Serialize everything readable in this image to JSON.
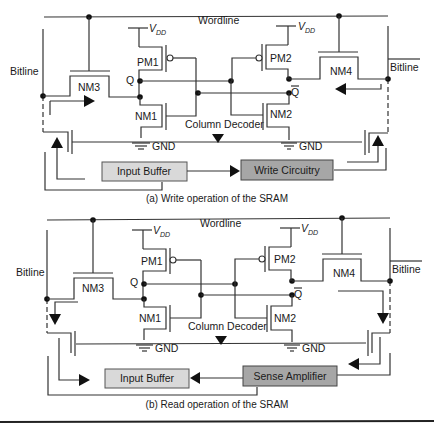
{
  "panels": [
    {
      "id": "write",
      "caption": "(a) Write operation of the SRAM",
      "wordline": "Wordline",
      "bitline_left": "Bitline",
      "bitline_right": "Bitline",
      "vdd_left": "V",
      "vdd_left_sub": "DD",
      "vdd_right": "V",
      "vdd_right_sub": "DD",
      "transistors": {
        "pm1": "PM1",
        "pm2": "PM2",
        "nm1": "NM1",
        "nm2": "NM2",
        "nm3": "NM3",
        "nm4": "NM4"
      },
      "node_q": "Q",
      "node_qbar": "Q",
      "column_decoder": "Column Decoder",
      "gnd_left": "GND",
      "gnd_right": "GND",
      "box_left": {
        "label": "Input Buffer",
        "color": "#d9d9d9"
      },
      "box_right": {
        "label": "Write Circuitry",
        "color": "#a6a6a6"
      }
    },
    {
      "id": "read",
      "caption": "(b) Read operation of the SRAM",
      "wordline": "Wordline",
      "bitline_left": "Bitline",
      "bitline_right": "Bitline",
      "vdd_left": "V",
      "vdd_left_sub": "DD",
      "vdd_right": "V",
      "vdd_right_sub": "DD",
      "transistors": {
        "pm1": "PM1",
        "pm2": "PM2",
        "nm1": "NM1",
        "nm2": "NM2",
        "nm3": "NM3",
        "nm4": "NM4"
      },
      "node_q": "Q",
      "node_qbar": "Q",
      "column_decoder": "Column Decoder",
      "gnd_left": "GND",
      "gnd_right": "GND",
      "box_left": {
        "label": "Input Buffer",
        "color": "#d9d9d9"
      },
      "box_right": {
        "label": "Sense Amplifier",
        "color": "#a6a6a6"
      }
    }
  ]
}
